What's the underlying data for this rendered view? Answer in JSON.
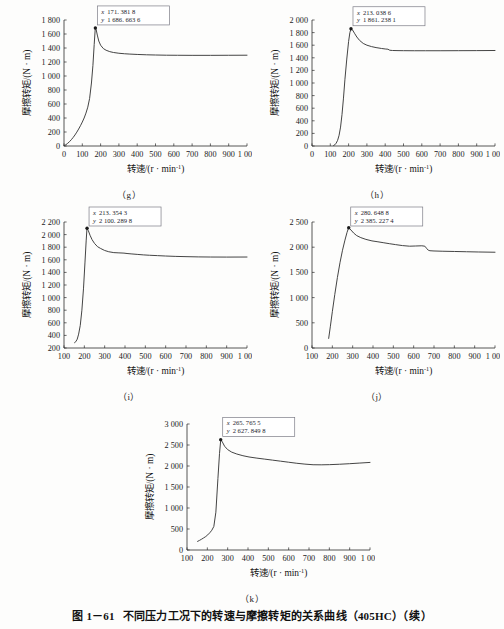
{
  "figure": {
    "caption_number": "图 1－61",
    "caption_text": "不同压力工况下的转速与摩擦转矩的关系曲线（405HC）（续）"
  },
  "axis_titles": {
    "x": "转速/(r · min",
    "x_sup": "-1",
    "x_close": ")",
    "y": "摩擦转矩/(N · m)"
  },
  "panel_labels": {
    "g": "（g）",
    "h": "（h）",
    "i": "（i）",
    "j": "（j）",
    "k": "（k）"
  },
  "chart_data": [
    {
      "id": "g",
      "type": "line",
      "title": "",
      "label": "（g）",
      "xlabel": "转速/(r · min⁻¹)",
      "ylabel": "摩擦转矩/(N · m)",
      "xlim": [
        0,
        1000
      ],
      "ylim": [
        0,
        1800
      ],
      "xticks": [
        0,
        100,
        200,
        300,
        400,
        500,
        600,
        700,
        800,
        900,
        1000
      ],
      "xticklabels": [
        "0",
        "100",
        "200",
        "300",
        "400",
        "500",
        "600",
        "700",
        "800",
        "900",
        "1 000"
      ],
      "yticks": [
        0,
        200,
        400,
        600,
        800,
        1000,
        1200,
        1400,
        1600,
        1800
      ],
      "yticklabels": [
        "0",
        "200",
        "400",
        "600",
        "800",
        "1 000",
        "1 200",
        "1 400",
        "1 600",
        "1 800"
      ],
      "grid": false,
      "annotation": {
        "x_label": "x",
        "x_value": "171. 381 8",
        "y_label": "y",
        "y_value": "1 686. 663 6",
        "point_x": 171.3818,
        "point_y": 1686.6636
      },
      "x": [
        0,
        10,
        20,
        30,
        40,
        50,
        60,
        70,
        80,
        90,
        100,
        110,
        120,
        130,
        140,
        150,
        158,
        165,
        171,
        176,
        182,
        190,
        200,
        215,
        230,
        250,
        270,
        300,
        330,
        360,
        400,
        450,
        500,
        560,
        620,
        700,
        800,
        900,
        1000
      ],
      "y": [
        5,
        18,
        38,
        62,
        90,
        122,
        158,
        198,
        242,
        290,
        342,
        400,
        470,
        555,
        680,
        900,
        1150,
        1450,
        1686,
        1660,
        1585,
        1500,
        1440,
        1392,
        1368,
        1348,
        1336,
        1325,
        1318,
        1313,
        1308,
        1303,
        1300,
        1297,
        1296,
        1295,
        1295,
        1296,
        1297
      ]
    },
    {
      "id": "h",
      "type": "line",
      "title": "",
      "label": "（h）",
      "xlabel": "转速/(r · min⁻¹)",
      "ylabel": "摩擦转矩/(N · m)",
      "xlim": [
        0,
        1000
      ],
      "ylim": [
        0,
        2000
      ],
      "xticks": [
        0,
        100,
        200,
        300,
        400,
        500,
        600,
        700,
        800,
        900,
        1000
      ],
      "xticklabels": [
        "0",
        "100",
        "200",
        "300",
        "400",
        "500",
        "600",
        "700",
        "800",
        "900",
        "1 000"
      ],
      "yticks": [
        0,
        200,
        400,
        600,
        800,
        1000,
        1200,
        1400,
        1600,
        1800,
        2000
      ],
      "yticklabels": [
        "0",
        "200",
        "400",
        "600",
        "800",
        "1 000",
        "1 200",
        "1 400",
        "1 600",
        "1 800",
        "2 000"
      ],
      "grid": false,
      "annotation": {
        "x_label": "x",
        "x_value": "213. 038 6",
        "y_label": "y",
        "y_value": "1 861. 238 1",
        "point_x": 213.0386,
        "point_y": 1861.2381
      },
      "x": [
        118,
        125,
        132,
        140,
        148,
        156,
        164,
        172,
        180,
        190,
        200,
        207,
        213,
        222,
        232,
        245,
        260,
        280,
        300,
        325,
        350,
        380,
        400,
        415,
        425,
        440,
        470,
        500,
        560,
        620,
        700,
        800,
        900,
        1000
      ],
      "y": [
        8,
        20,
        45,
        90,
        170,
        300,
        500,
        760,
        1060,
        1380,
        1660,
        1800,
        1861,
        1840,
        1790,
        1730,
        1676,
        1628,
        1600,
        1578,
        1562,
        1548,
        1540,
        1536,
        1520,
        1516,
        1514,
        1513,
        1512,
        1512,
        1512,
        1513,
        1514,
        1516
      ]
    },
    {
      "id": "i",
      "type": "line",
      "title": "",
      "label": "（i）",
      "xlabel": "转速/(r · min⁻¹)",
      "ylabel": "摩擦转矩/(N · m)",
      "xlim": [
        100,
        1000
      ],
      "ylim": [
        200,
        2200
      ],
      "xticks": [
        100,
        200,
        300,
        400,
        500,
        600,
        700,
        800,
        900,
        1000
      ],
      "xticklabels": [
        "100",
        "200",
        "300",
        "400",
        "500",
        "600",
        "700",
        "800",
        "900",
        "1 000"
      ],
      "yticks": [
        200,
        400,
        600,
        800,
        1000,
        1200,
        1400,
        1600,
        1800,
        2000,
        2200
      ],
      "yticklabels": [
        "200",
        "400",
        "600",
        "800",
        "1 000",
        "1 200",
        "1 400",
        "1 600",
        "1 800",
        "2 000",
        "2 200"
      ],
      "grid": false,
      "annotation": {
        "x_label": "x",
        "x_value": "213. 354 3",
        "y_label": "y",
        "y_value": "2 100. 289 8",
        "point_x": 213.3543,
        "point_y": 2100.2898
      },
      "x": [
        152,
        158,
        165,
        172,
        180,
        188,
        196,
        203,
        209,
        213,
        220,
        228,
        238,
        250,
        265,
        280,
        300,
        320,
        345,
        370,
        395,
        410,
        430,
        460,
        490,
        520,
        560,
        600,
        650,
        700,
        760,
        820,
        900,
        1000
      ],
      "y": [
        285,
        300,
        340,
        420,
        560,
        800,
        1150,
        1550,
        1900,
        2100,
        2060,
        1990,
        1920,
        1860,
        1808,
        1780,
        1748,
        1728,
        1714,
        1710,
        1706,
        1700,
        1694,
        1686,
        1678,
        1672,
        1666,
        1660,
        1654,
        1650,
        1646,
        1644,
        1643,
        1644
      ]
    },
    {
      "id": "j",
      "type": "line",
      "title": "",
      "label": "（j）",
      "xlabel": "转速/(r · min⁻¹)",
      "ylabel": "摩擦转矩/(N · m)",
      "xlim": [
        100,
        1000
      ],
      "ylim": [
        0,
        2500
      ],
      "xticks": [
        100,
        200,
        300,
        400,
        500,
        600,
        700,
        800,
        900,
        1000
      ],
      "xticklabels": [
        "100",
        "200",
        "300",
        "400",
        "500",
        "600",
        "700",
        "800",
        "900",
        "1 000"
      ],
      "yticks": [
        0,
        500,
        1000,
        1500,
        2000,
        2500
      ],
      "yticklabels": [
        "0",
        "500",
        "1 000",
        "1 500",
        "2 000",
        "2 500"
      ],
      "grid": false,
      "annotation": {
        "x_label": "x",
        "x_value": "280. 648 8",
        "y_label": "y",
        "y_value": "2 385. 227 4",
        "point_x": 280.6488,
        "point_y": 2385.2274
      },
      "x": [
        182,
        190,
        200,
        212,
        225,
        238,
        250,
        262,
        272,
        280,
        292,
        305,
        320,
        340,
        365,
        395,
        420,
        450,
        480,
        510,
        545,
        580,
        610,
        640,
        655,
        665,
        672,
        680,
        700,
        740,
        800,
        860,
        920,
        1000
      ],
      "y": [
        190,
        420,
        720,
        1060,
        1400,
        1700,
        1940,
        2140,
        2290,
        2385,
        2340,
        2280,
        2230,
        2190,
        2155,
        2125,
        2110,
        2090,
        2070,
        2052,
        2032,
        2020,
        2024,
        2028,
        2020,
        1970,
        1940,
        1930,
        1925,
        1920,
        1915,
        1910,
        1905,
        1900
      ]
    },
    {
      "id": "k",
      "type": "line",
      "title": "",
      "label": "（k）",
      "xlabel": "转速/(r · min⁻¹)",
      "ylabel": "摩擦转矩/(N · m)",
      "xlim": [
        100,
        1000
      ],
      "ylim": [
        0,
        3000
      ],
      "xticks": [
        100,
        200,
        300,
        400,
        500,
        600,
        700,
        800,
        900,
        1000
      ],
      "xticklabels": [
        "100",
        "200",
        "300",
        "400",
        "500",
        "600",
        "700",
        "800",
        "900",
        "1 000"
      ],
      "yticks": [
        0,
        500,
        1000,
        1500,
        2000,
        2500,
        3000
      ],
      "yticklabels": [
        "0",
        "500",
        "1 000",
        "1 500",
        "2 000",
        "2 500",
        "3 000"
      ],
      "grid": false,
      "annotation": {
        "x_label": "x",
        "x_value": "265. 765 5",
        "y_label": "y",
        "y_value": "2 627. 849 8",
        "point_x": 265.7655,
        "point_y": 2627.8498
      },
      "x": [
        152,
        162,
        172,
        182,
        192,
        202,
        212,
        222,
        232,
        242,
        252,
        260,
        266,
        274,
        285,
        300,
        320,
        345,
        375,
        405,
        440,
        480,
        520,
        560,
        600,
        640,
        680,
        720,
        760,
        800,
        850,
        900,
        950,
        1000
      ],
      "y": [
        205,
        230,
        258,
        288,
        320,
        360,
        410,
        470,
        560,
        900,
        1700,
        2300,
        2628,
        2570,
        2470,
        2390,
        2330,
        2285,
        2245,
        2215,
        2190,
        2165,
        2140,
        2115,
        2090,
        2065,
        2045,
        2030,
        2028,
        2032,
        2042,
        2055,
        2070,
        2085
      ]
    }
  ]
}
